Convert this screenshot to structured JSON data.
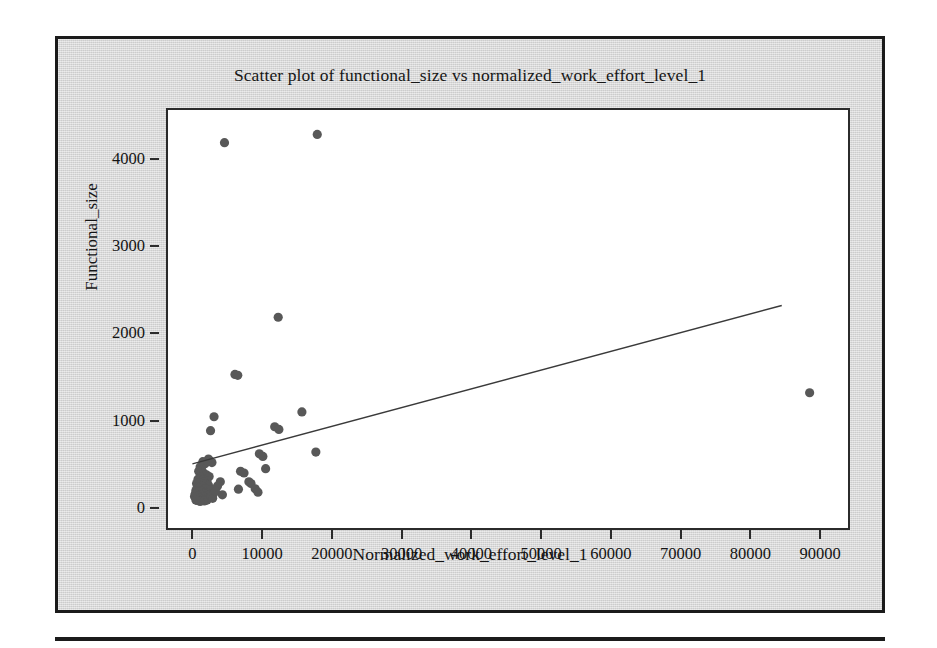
{
  "figure": {
    "title": "Scatter plot of functional_size vs normalized_work_effort_level_1",
    "x_axis_title": "Normalized_work_effort_level_1",
    "y_axis_title": "Functional_size",
    "marker_color": "#585858",
    "line_color": "#3a3a3a",
    "frame_color": "#2b2b2b",
    "background_color": "#d7d7d7",
    "plot_background_color": "#ffffff"
  },
  "chart_data": {
    "type": "scatter",
    "title": "Scatter plot of functional_size vs normalized_work_effort_level_1",
    "xlabel": "Normalized_work_effort_level_1",
    "ylabel": "Functional_size",
    "xlim": [
      -3500,
      94000
    ],
    "ylim": [
      -230,
      4560
    ],
    "xticks": [
      0,
      10000,
      20000,
      30000,
      40000,
      50000,
      60000,
      70000,
      80000,
      90000
    ],
    "xticklabels": [
      "0",
      "10000",
      "20000",
      "30000",
      "40000",
      "50000",
      "60000",
      "70000",
      "80000",
      "90000"
    ],
    "yticks": [
      0,
      1000,
      2000,
      3000,
      4000
    ],
    "yticklabels": [
      "0",
      "1000",
      "2000",
      "3000",
      "4000"
    ],
    "grid": false,
    "legend": false,
    "series": [
      {
        "name": "functional_size",
        "marker": "circle",
        "color": "#585858",
        "points": [
          [
            4600,
            4185
          ],
          [
            17900,
            4280
          ],
          [
            12300,
            2185
          ],
          [
            6100,
            1530
          ],
          [
            6500,
            1520
          ],
          [
            15700,
            1100
          ],
          [
            88500,
            1320
          ],
          [
            3100,
            1045
          ],
          [
            2600,
            885
          ],
          [
            11800,
            930
          ],
          [
            12400,
            900
          ],
          [
            17700,
            640
          ],
          [
            9600,
            620
          ],
          [
            10100,
            590
          ],
          [
            2300,
            560
          ],
          [
            2500,
            540
          ],
          [
            2800,
            520
          ],
          [
            1500,
            530
          ],
          [
            1800,
            505
          ],
          [
            10500,
            450
          ],
          [
            6900,
            420
          ],
          [
            7400,
            400
          ],
          [
            8100,
            300
          ],
          [
            8400,
            280
          ],
          [
            9000,
            220
          ],
          [
            9400,
            180
          ],
          [
            6600,
            215
          ],
          [
            4000,
            300
          ],
          [
            3600,
            250
          ],
          [
            1100,
            470
          ],
          [
            1300,
            440
          ],
          [
            900,
            420
          ],
          [
            1600,
            400
          ],
          [
            2000,
            380
          ],
          [
            2400,
            360
          ],
          [
            1200,
            350
          ],
          [
            800,
            330
          ],
          [
            1500,
            320
          ],
          [
            2100,
            310
          ],
          [
            1700,
            300
          ],
          [
            1000,
            290
          ],
          [
            600,
            280
          ],
          [
            1900,
            270
          ],
          [
            2300,
            260
          ],
          [
            1400,
            250
          ],
          [
            700,
            240
          ],
          [
            1100,
            230
          ],
          [
            1800,
            220
          ],
          [
            2600,
            210
          ],
          [
            500,
            200
          ],
          [
            1300,
            195
          ],
          [
            900,
            185
          ],
          [
            2000,
            175
          ],
          [
            1600,
            165
          ],
          [
            400,
            160
          ],
          [
            1200,
            150
          ],
          [
            2400,
            145
          ],
          [
            800,
            135
          ],
          [
            1500,
            125
          ],
          [
            1000,
            115
          ],
          [
            1900,
            105
          ],
          [
            600,
            100
          ],
          [
            1300,
            95
          ],
          [
            2100,
            90
          ],
          [
            700,
            85
          ],
          [
            1700,
            80
          ],
          [
            1100,
            75
          ],
          [
            2700,
            130
          ],
          [
            3000,
            160
          ],
          [
            2900,
            110
          ],
          [
            300,
            130
          ],
          [
            500,
            90
          ],
          [
            3300,
            190
          ],
          [
            4300,
            150
          ]
        ]
      }
    ],
    "trendline": {
      "name": "fit-line",
      "color": "#3a3a3a",
      "x_start": 0,
      "y_start": 505,
      "x_end": 84500,
      "y_end": 2320
    }
  }
}
